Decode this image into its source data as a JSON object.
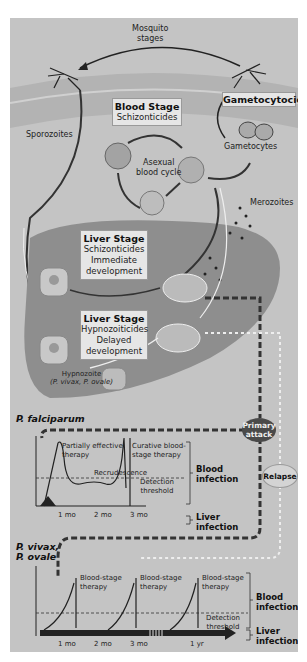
{
  "diagram": {
    "top": {
      "mosquito_label": "Mosquito\nstages",
      "mosquito_line1": "Mosquito",
      "mosquito_line2": "stages",
      "gametocytocides": "Gametocytocides",
      "sporozoites": "Sporozoites",
      "gametocytes": "Gametocytes",
      "merozoites": "Merozoites"
    },
    "blood_stage": {
      "title": "Blood Stage",
      "subtitle": "Schizonticides",
      "cycle_line1": "Asexual",
      "cycle_line2": "blood cycle"
    },
    "liver_stage_1": {
      "title": "Liver Stage",
      "subtitle": "Schizonticides",
      "note_line1": "Immediate",
      "note_line2": "development"
    },
    "liver_stage_2": {
      "title": "Liver Stage",
      "subtitle": "Hypnozoiticides",
      "note_line1": "Delayed",
      "note_line2": "development"
    },
    "hypnozoite": {
      "line1": "Hypnozoite",
      "line2": "(P. vivax, P. ovale)"
    },
    "ovals": {
      "primary_line1": "Primary",
      "primary_line2": "attack",
      "relapse": "Relapse"
    },
    "falciparum": {
      "title": "P. falciparum",
      "partial_line1": "Partially effective",
      "partial_line2": "therapy",
      "curative_line1": "Curative blood-",
      "curative_line2": "stage therapy",
      "recrudescence": "Recrudescence",
      "detection_line1": "Detection",
      "detection_line2": "threshold",
      "blood_line1": "Blood",
      "blood_line2": "infection",
      "liver_line1": "Liver",
      "liver_line2": "infection",
      "ticks": [
        "1 mo",
        "2 mo",
        "3 mo"
      ]
    },
    "vivax": {
      "title_line1": "P. vivax,",
      "title_line2": "P. ovale",
      "therapy_line1": "Blood-stage",
      "therapy_line2": "therapy",
      "detection_line1": "Detection",
      "detection_line2": "threshold",
      "blood_line1": "Blood",
      "blood_line2": "infection",
      "liver_line1": "Liver",
      "liver_line2": "infection",
      "ticks": [
        "1 mo",
        "2 mo",
        "3 mo",
        "1 yr"
      ]
    },
    "colors": {
      "background": "#c4c4c4",
      "skin": "#b0b0b0",
      "liver": "#8e8e8e",
      "box": "#e6e6e6",
      "primary_oval": "#4a4a4a",
      "relapse_oval": "#d4d4d4"
    }
  }
}
